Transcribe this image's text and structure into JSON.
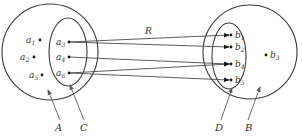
{
  "diagram": {
    "relation_label": "R",
    "sets": [
      {
        "id": "A",
        "label": "A",
        "shape": "circle",
        "cx": 50,
        "cy": 52,
        "r": 48
      },
      {
        "id": "C",
        "label": "C",
        "shape": "ellipse",
        "cx": 68,
        "cy": 52,
        "rx": 19,
        "ry": 34,
        "subset_of": "A"
      },
      {
        "id": "B",
        "label": "B",
        "shape": "circle",
        "cx": 250,
        "cy": 52,
        "r": 47
      },
      {
        "id": "D",
        "label": "D",
        "shape": "ellipse",
        "cx": 229,
        "cy": 56,
        "rx": 17,
        "ry": 33,
        "subset_of": "B"
      }
    ],
    "elements_A": [
      {
        "name": "a",
        "sub": "1",
        "x": 40,
        "y": 40,
        "in": "A"
      },
      {
        "name": "a",
        "sub": "2",
        "x": 34,
        "y": 57,
        "in": "A"
      },
      {
        "name": "a",
        "sub": "5",
        "x": 42,
        "y": 75,
        "in": "A"
      },
      {
        "name": "a",
        "sub": "3",
        "x": 69,
        "y": 42,
        "in": "C"
      },
      {
        "name": "a",
        "sub": "4",
        "x": 69,
        "y": 57,
        "in": "C"
      },
      {
        "name": "a",
        "sub": "6",
        "x": 69,
        "y": 73,
        "in": "C"
      }
    ],
    "elements_B": [
      {
        "name": "b",
        "sub": "1",
        "x": 231,
        "y": 35,
        "in": "D"
      },
      {
        "name": "b",
        "sub": "2",
        "x": 231,
        "y": 47,
        "in": "D"
      },
      {
        "name": "b",
        "sub": "4",
        "x": 231,
        "y": 64,
        "in": "D"
      },
      {
        "name": "b",
        "sub": "5",
        "x": 231,
        "y": 80,
        "in": "D"
      },
      {
        "name": "b",
        "sub": "3",
        "x": 267,
        "y": 55,
        "in": "B"
      }
    ],
    "relation_pairs": [
      {
        "from": "a3",
        "to": "b1"
      },
      {
        "from": "a3",
        "to": "b2"
      },
      {
        "from": "a4",
        "to": "b4"
      },
      {
        "from": "a6",
        "to": "b4"
      },
      {
        "from": "a6",
        "to": "b5"
      }
    ],
    "set_labels": {
      "A": "A",
      "C": "C",
      "D": "D",
      "B": "B"
    }
  }
}
